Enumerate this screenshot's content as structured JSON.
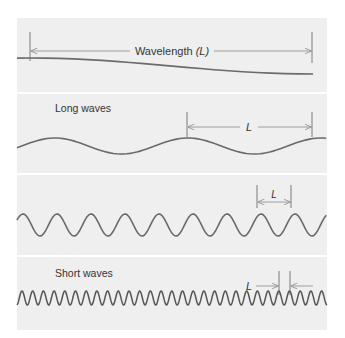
{
  "colors": {
    "background": "#ffffff",
    "panel": "#efefef",
    "wave": "#6a6a6a",
    "dimension": "#8a8a8a",
    "text": "#333333"
  },
  "panels": [
    {
      "id": "wavelength-definition",
      "label": "",
      "marker_label": "Wavelength",
      "marker_symbol": "(L)",
      "wave": {
        "period_px": 564,
        "amplitude_px": 8,
        "center_y": 66,
        "phase_peak_x": 30
      }
    },
    {
      "id": "long-waves",
      "label": "Long waves",
      "marker_label": "L",
      "wave": {
        "period_px": 133,
        "amplitude_px": 8,
        "center_y": 146,
        "phase_peak_x": 55
      }
    },
    {
      "id": "medium-waves",
      "label": "",
      "marker_label": "L",
      "wave": {
        "period_px": 34,
        "amplitude_px": 11,
        "center_y": 225,
        "phase_peak_x": 23
      }
    },
    {
      "id": "short-waves",
      "label": "Short waves",
      "marker_label": "L",
      "wave": {
        "period_px": 10.7,
        "amplitude_px": 7,
        "center_y": 298,
        "phase_peak_x": 22
      }
    }
  ]
}
